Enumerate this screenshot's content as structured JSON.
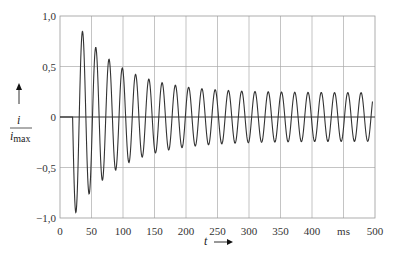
{
  "chart_data": {
    "type": "line",
    "title": "",
    "xlabel": "t",
    "xunit": "ms",
    "ylabel": "i / i_max",
    "ylabel_num": "i",
    "ylabel_den": "i",
    "ylabel_den_sub": "max",
    "xlim": [
      0,
      500
    ],
    "ylim": [
      -1.0,
      1.0
    ],
    "grid": true,
    "x_ticks": [
      "0",
      "50",
      "100",
      "150",
      "200",
      "250",
      "300",
      "350",
      "400",
      "ms",
      "500"
    ],
    "x_tick_values": [
      0,
      50,
      100,
      150,
      200,
      250,
      300,
      350,
      400,
      450,
      500
    ],
    "y_ticks": [
      "1,0",
      "0,5",
      "0",
      "-0,5",
      "-1,0"
    ],
    "y_tick_values": [
      1.0,
      0.5,
      0,
      -0.5,
      -1.0
    ],
    "series": [
      {
        "name": "i/i_max",
        "description": "Damped 50 Hz oscillation starting at t≈20 ms, decaying to steady amplitude ≈0.24",
        "model": {
          "t_start": 20,
          "frequency_hz": 50,
          "steady_amplitude": 0.24,
          "decay_amplitude": 0.76,
          "tau_ms": 70
        },
        "peaks_x": [
          33,
          43,
          53,
          63,
          73,
          83,
          93,
          103,
          113,
          123,
          133,
          143,
          153,
          163,
          173,
          183,
          193,
          213,
          253,
          293,
          333,
          373,
          413,
          453,
          493
        ],
        "peaks_y": [
          -1.0,
          0.92,
          -0.84,
          0.78,
          -0.7,
          0.66,
          -0.6,
          0.6,
          -0.55,
          0.51,
          -0.5,
          0.49,
          -0.45,
          0.44,
          -0.42,
          0.41,
          -0.4,
          0.37,
          0.33,
          0.29,
          0.27,
          0.26,
          0.25,
          0.24,
          0.24
        ]
      }
    ]
  }
}
